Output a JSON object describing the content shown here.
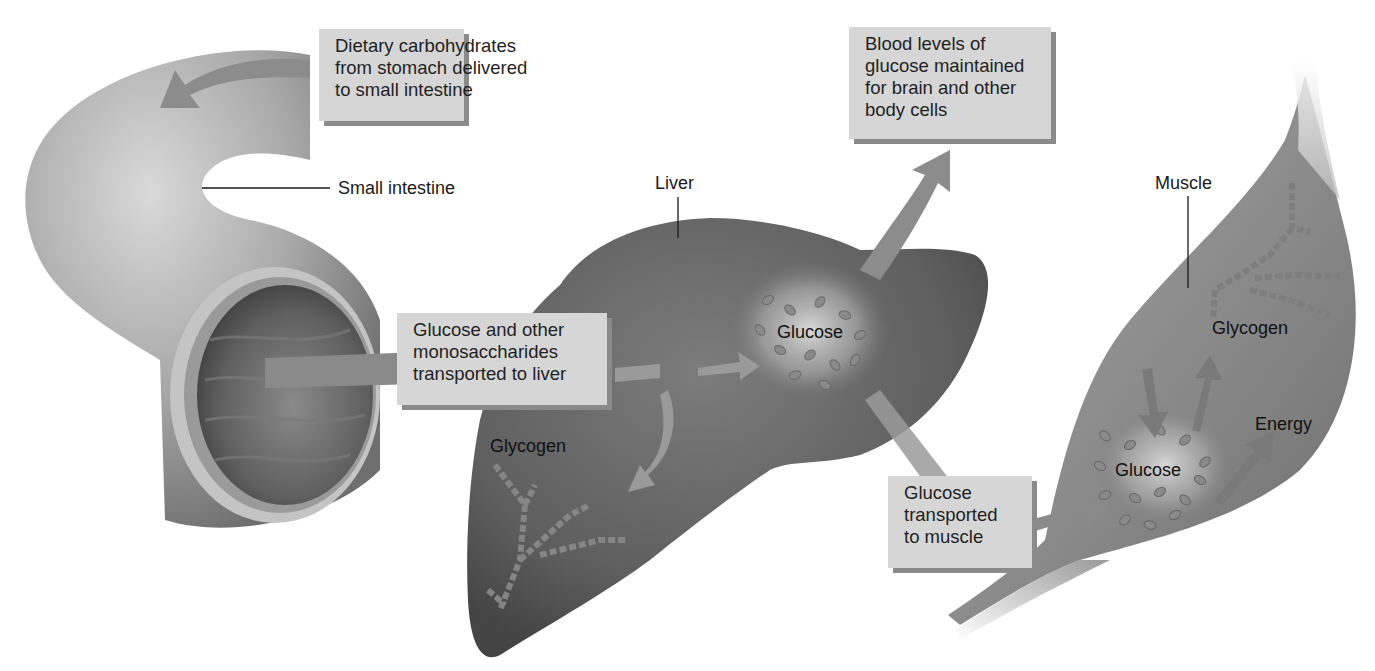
{
  "diagram": {
    "type": "process-flow illustration",
    "callouts": {
      "dietary": {
        "lines": [
          "Dietary carbohydrates",
          "from stomach delivered",
          "to small intestine"
        ]
      },
      "blood": {
        "lines": [
          "Blood levels of",
          "glucose maintained",
          "for brain and other",
          "body cells"
        ]
      },
      "transport_liver": {
        "lines": [
          "Glucose and other",
          "monosaccharides",
          "transported to liver"
        ]
      },
      "transport_muscle": {
        "lines": [
          "Glucose",
          "transported",
          "to muscle"
        ]
      }
    },
    "organ_labels": {
      "small_intestine": "Small intestine",
      "liver": "Liver",
      "muscle": "Muscle"
    },
    "inner_labels": {
      "liver_glucose": "Glucose",
      "liver_glycogen": "Glycogen",
      "muscle_glycogen": "Glycogen",
      "muscle_glucose": "Glucose",
      "muscle_energy": "Energy"
    },
    "colors": {
      "callout_bg": "#d6d6d6",
      "callout_shadow": "#8a8a8a",
      "arrow": "#8c8c8c",
      "liver": "#6b6b6b",
      "muscle": "#8a8a8a",
      "intestine": "#a9a9a9"
    },
    "flows": [
      {
        "from": "stomach",
        "to": "small intestine"
      },
      {
        "from": "small intestine",
        "to": "liver"
      },
      {
        "from": "liver glucose",
        "to": "blood / brain and body cells"
      },
      {
        "from": "liver glucose",
        "to": "liver glycogen"
      },
      {
        "from": "liver glucose",
        "to": "muscle"
      },
      {
        "from": "muscle glycogen",
        "to": "muscle glucose"
      },
      {
        "from": "muscle glucose",
        "to": "muscle glycogen"
      },
      {
        "from": "muscle glucose",
        "to": "energy"
      }
    ]
  }
}
